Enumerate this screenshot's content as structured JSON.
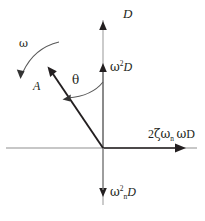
{
  "diagram": {
    "background_color": "#ffffff",
    "axis_color": "#b3b3b3",
    "vector_color": "#231f20",
    "text_color": "#231f20",
    "origin": {
      "x": 103,
      "y": 148
    }
  },
  "axes": {
    "vertical": {
      "name": "D-axis",
      "top_label": "D",
      "top_arrow": {
        "x": 103,
        "y": 22
      },
      "bottom_arrow": {
        "x": 103,
        "y": 196
      },
      "mid_arrow": {
        "x": 103,
        "y": 64
      }
    },
    "horizontal": {
      "name": "damping-axis",
      "right_arrow": {
        "x": 186,
        "y": 148
      }
    }
  },
  "labels": {
    "d_axis": "D",
    "omega_squared_d": {
      "greek": "ω",
      "sup": "2",
      "var": "D"
    },
    "omega_n_squared_d": {
      "greek": "ω",
      "sub": "n",
      "sup": "2",
      "var": "D"
    },
    "damping_axis": {
      "coef": "2",
      "zeta": "ζ",
      "omega": "ω",
      "sub": "n",
      "omega2": "ω",
      "var": "D"
    },
    "theta": "θ",
    "amplitude": "A",
    "omega_rotation": "ω"
  },
  "vectors": [
    {
      "name": "amplitude-vector-A",
      "label": "A",
      "from": {
        "x": 103,
        "y": 148
      },
      "to": {
        "x": 48,
        "y": 67
      }
    }
  ],
  "arcs": [
    {
      "name": "theta-angle-arc",
      "label": "θ",
      "description": "angle between vertical D axis and vector A"
    },
    {
      "name": "omega-rotation-arc",
      "label": "ω",
      "description": "counterclockwise rotation direction arrow"
    }
  ]
}
